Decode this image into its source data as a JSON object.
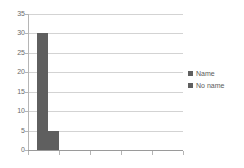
{
  "chart_data": {
    "type": "bar",
    "title": "",
    "subtitle": "",
    "xlabel": "",
    "ylabel": "",
    "categories": [
      ""
    ],
    "series": [
      {
        "name": "Name",
        "values": [
          30
        ],
        "color": "#5f5f5f"
      },
      {
        "name": "No name",
        "values": [
          5
        ],
        "color": "#5f5f5f"
      }
    ],
    "ylim": [
      0,
      35
    ],
    "yticks": [
      0,
      5,
      10,
      15,
      20,
      25,
      30,
      35
    ],
    "ytick_labels": [
      "0",
      "5",
      "10",
      "15",
      "20",
      "25",
      "30",
      "35"
    ],
    "xticks": 5,
    "xtick_labels": [
      "",
      "",
      "",
      "",
      ""
    ],
    "grid": "horizontal",
    "legend_position": "right"
  },
  "legend": {
    "items": [
      {
        "label": "Name",
        "color": "#5f5f5f"
      },
      {
        "label": "No name",
        "color": "#5f5f5f"
      }
    ]
  },
  "axes": {
    "y_tick_color": "#6a6a6a",
    "gridline_color": "#d3d3d3",
    "axis_line_color": "#b5b5b5"
  }
}
